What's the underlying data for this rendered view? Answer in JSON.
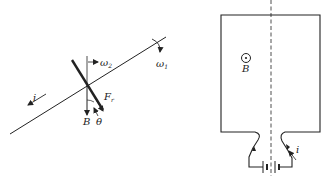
{
  "figure_left": {
    "labels": {
      "current": "i",
      "omega_rod": "ω",
      "omega_rod_sub": "2",
      "omega_axis": "ω",
      "omega_axis_sub": "1",
      "force": "F",
      "force_sub": "r",
      "field": "B",
      "angle": "θ"
    }
  },
  "figure_right": {
    "labels": {
      "field": "B",
      "current": "i"
    },
    "field_symbol": "out-of-page (dot in circle)"
  },
  "colors": {
    "ink": "#222222",
    "background": "#ffffff"
  }
}
